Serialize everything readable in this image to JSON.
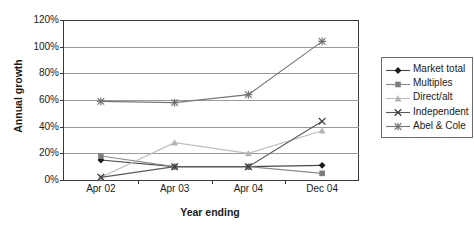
{
  "chart_data": {
    "type": "line",
    "title": "",
    "xlabel": "Year ending",
    "ylabel": "Annual growth",
    "categories": [
      "Apr 02",
      "Apr 03",
      "Apr 04",
      "Dec 04"
    ],
    "ytick_labels": [
      "0%",
      "20%",
      "40%",
      "60%",
      "80%",
      "100%",
      "120%"
    ],
    "ytick_values": [
      0,
      20,
      40,
      60,
      80,
      100,
      120
    ],
    "ylim": [
      0,
      120
    ],
    "grid": true,
    "legend_position": "right",
    "series": [
      {
        "name": "Market total",
        "marker": "diamond",
        "color": "#1c1c1c",
        "line_color": "#4a4a4a",
        "values": [
          15,
          10,
          10,
          11
        ]
      },
      {
        "name": "Multiples",
        "marker": "square",
        "color": "#7d7d7d",
        "line_color": "#8c8c8c",
        "values": [
          18,
          10,
          10,
          5
        ]
      },
      {
        "name": "Direct/alt",
        "marker": "triangle",
        "color": "#b4b4b4",
        "line_color": "#bdbdbd",
        "values": [
          2,
          28,
          20,
          37
        ]
      },
      {
        "name": "Independent",
        "marker": "x",
        "color": "#3c3c3c",
        "line_color": "#5a5a5a",
        "values": [
          2,
          10,
          10,
          44
        ]
      },
      {
        "name": "Abel & Cole",
        "marker": "asterisk",
        "color": "#6e6e6e",
        "line_color": "#777777",
        "values": [
          59,
          58,
          64,
          104
        ]
      }
    ]
  }
}
